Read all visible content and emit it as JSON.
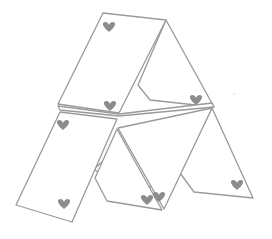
{
  "illustration": {
    "subject": "house of cards",
    "style": "line-art",
    "card_count": 6,
    "suit": "hearts",
    "colors": {
      "outline": "#9a9a9a",
      "heart": "#8c8c8c",
      "background": "#ffffff"
    }
  }
}
